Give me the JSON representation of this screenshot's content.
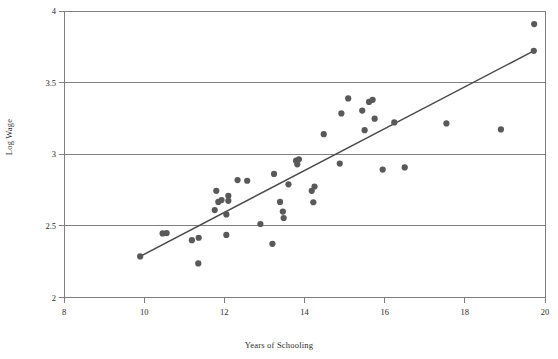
{
  "chart_data": {
    "type": "scatter",
    "title": "",
    "xlabel": "Years of Schooling",
    "ylabel": "Log Wage",
    "xlim": [
      8,
      20
    ],
    "ylim": [
      2,
      4
    ],
    "xticks": [
      "8",
      "10",
      "12",
      "14",
      "16",
      "18",
      "20"
    ],
    "xtick_values": [
      8,
      10,
      12,
      14,
      16,
      18,
      20
    ],
    "yticks": [
      "2",
      "2.5",
      "3",
      "3.5",
      "4"
    ],
    "ytick_values": [
      2,
      2.5,
      3,
      3.5,
      4
    ],
    "grid": "horizontal",
    "legend": "none",
    "marker_color": "#595959",
    "line_color": "#4a4a4a",
    "axis_color": "#808080",
    "marker_size": 6.2,
    "points": [
      {
        "x": 9.9,
        "y": 2.287
      },
      {
        "x": 10.46,
        "y": 2.447
      },
      {
        "x": 10.56,
        "y": 2.45
      },
      {
        "x": 11.19,
        "y": 2.4
      },
      {
        "x": 11.35,
        "y": 2.238
      },
      {
        "x": 11.36,
        "y": 2.417
      },
      {
        "x": 11.76,
        "y": 2.61
      },
      {
        "x": 11.8,
        "y": 2.745
      },
      {
        "x": 11.85,
        "y": 2.667
      },
      {
        "x": 11.93,
        "y": 2.68
      },
      {
        "x": 12.05,
        "y": 2.58
      },
      {
        "x": 12.05,
        "y": 2.437
      },
      {
        "x": 12.1,
        "y": 2.71
      },
      {
        "x": 12.1,
        "y": 2.675
      },
      {
        "x": 12.33,
        "y": 2.82
      },
      {
        "x": 12.57,
        "y": 2.815
      },
      {
        "x": 12.9,
        "y": 2.513
      },
      {
        "x": 13.24,
        "y": 2.863
      },
      {
        "x": 13.2,
        "y": 2.375
      },
      {
        "x": 13.39,
        "y": 2.667
      },
      {
        "x": 13.46,
        "y": 2.6
      },
      {
        "x": 13.48,
        "y": 2.555
      },
      {
        "x": 13.6,
        "y": 2.79
      },
      {
        "x": 13.79,
        "y": 2.955
      },
      {
        "x": 13.86,
        "y": 2.965
      },
      {
        "x": 13.82,
        "y": 2.93
      },
      {
        "x": 14.18,
        "y": 2.745
      },
      {
        "x": 14.25,
        "y": 2.775
      },
      {
        "x": 14.22,
        "y": 2.665
      },
      {
        "x": 14.48,
        "y": 3.14
      },
      {
        "x": 14.88,
        "y": 2.935
      },
      {
        "x": 14.92,
        "y": 3.285
      },
      {
        "x": 15.09,
        "y": 3.39
      },
      {
        "x": 15.44,
        "y": 3.305
      },
      {
        "x": 15.5,
        "y": 3.168
      },
      {
        "x": 15.61,
        "y": 3.365
      },
      {
        "x": 15.7,
        "y": 3.38
      },
      {
        "x": 15.75,
        "y": 3.248
      },
      {
        "x": 15.95,
        "y": 2.893
      },
      {
        "x": 16.24,
        "y": 3.222
      },
      {
        "x": 16.5,
        "y": 2.908
      },
      {
        "x": 17.54,
        "y": 3.215
      },
      {
        "x": 18.9,
        "y": 3.173
      },
      {
        "x": 19.73,
        "y": 3.909
      },
      {
        "x": 19.72,
        "y": 3.722
      }
    ],
    "trendline": {
      "label": "fitted regression line",
      "x0": 9.9,
      "y0": 2.287,
      "x1": 19.72,
      "y1": 3.722
    }
  }
}
